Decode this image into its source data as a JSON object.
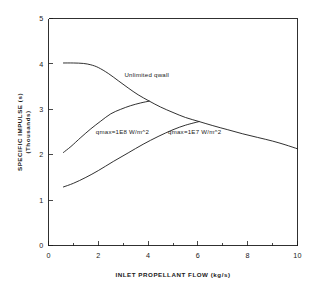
{
  "chart_data": {
    "type": "line",
    "title": "",
    "xlabel": "INLET PROPELLANT FLOW (kg/s)",
    "ylabel": "SPECIFIC IMPULSE (s)",
    "ylabel_sub": "(Thousands)",
    "xlim": [
      0,
      10
    ],
    "ylim": [
      0,
      5
    ],
    "xticks": [
      0,
      2,
      4,
      6,
      8,
      10
    ],
    "xtick_labels": [
      "0",
      "2",
      "4",
      "6",
      "8",
      "10"
    ],
    "xminor_ticks": [
      1,
      3,
      5,
      7,
      9
    ],
    "yticks": [
      0,
      1,
      2,
      3,
      4,
      5
    ],
    "ytick_labels": [
      "0",
      "1",
      "2",
      "3",
      "4",
      "5"
    ],
    "grid": false,
    "legend": "inline-annotations",
    "series": [
      {
        "name": "Unlimited qwall",
        "label": "Unlimited qwall",
        "label_x": 3.05,
        "label_y": 3.72,
        "x": [
          0.6,
          1.0,
          1.4,
          1.7,
          2.0,
          2.4,
          2.8,
          3.2,
          3.6,
          4.05,
          4.5,
          5.0,
          5.5,
          6.05,
          6.6,
          7.2,
          7.8,
          8.4,
          9.0,
          9.5,
          10.0
        ],
        "y": [
          4.02,
          4.02,
          4.01,
          3.98,
          3.92,
          3.79,
          3.63,
          3.47,
          3.32,
          3.18,
          3.05,
          2.93,
          2.82,
          2.73,
          2.64,
          2.55,
          2.46,
          2.38,
          2.3,
          2.22,
          2.13
        ]
      },
      {
        "name": "qmax=1E8 W/m^2",
        "label": "qmax=1E8 W/m^2",
        "label_x": 1.9,
        "label_y": 2.46,
        "x": [
          0.6,
          0.9,
          1.3,
          1.7,
          2.1,
          2.5,
          2.9,
          3.3,
          3.7,
          4.05
        ],
        "y": [
          2.05,
          2.18,
          2.38,
          2.57,
          2.74,
          2.9,
          3.0,
          3.08,
          3.14,
          3.18
        ]
      },
      {
        "name": "qmax=1E7 W/m^2",
        "label": "qmax=1E7 W/m^2",
        "label_x": 4.8,
        "label_y": 2.46,
        "x": [
          0.6,
          1.0,
          1.5,
          2.0,
          2.6,
          3.2,
          3.8,
          4.4,
          5.0,
          5.5,
          6.05
        ],
        "y": [
          1.29,
          1.37,
          1.5,
          1.65,
          1.85,
          2.04,
          2.23,
          2.4,
          2.55,
          2.65,
          2.73
        ]
      }
    ]
  },
  "figure": {
    "name": "specific-impulse-vs-inlet-propellant-flow-chart"
  }
}
